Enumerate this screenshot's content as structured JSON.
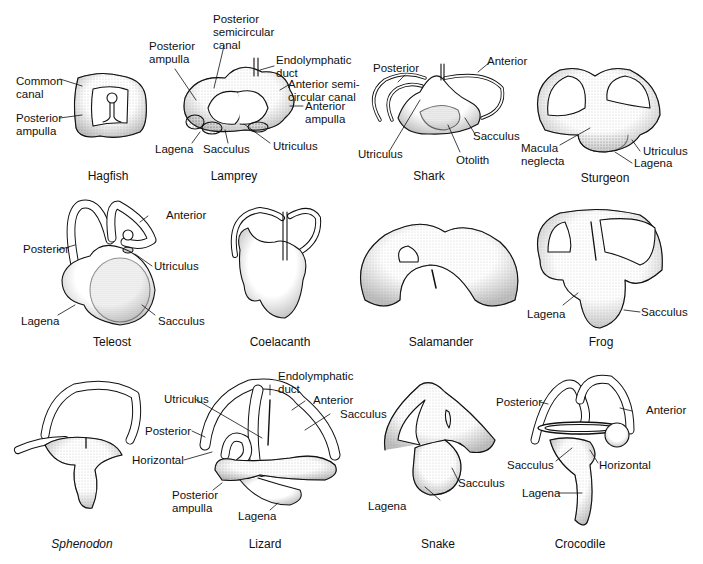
{
  "figure": {
    "panels": [
      {
        "id": "hagfish",
        "caption": "Hagfish",
        "italic": false,
        "labels": [
          "Common canal",
          "Posterior ampulla"
        ]
      },
      {
        "id": "lamprey",
        "caption": "Lamprey",
        "italic": false,
        "labels": [
          "Posterior semicircular canal",
          "Posterior ampulla",
          "Endolymphatic duct",
          "Anterior semi-circular canal",
          "Anterior ampulla",
          "Lagena",
          "Sacculus",
          "Utriculus"
        ]
      },
      {
        "id": "shark",
        "caption": "Shark",
        "italic": false,
        "labels": [
          "Posterior",
          "Anterior",
          "Sacculus",
          "Utriculus",
          "Otolith"
        ]
      },
      {
        "id": "sturgeon",
        "caption": "Sturgeon",
        "italic": false,
        "labels": [
          "Macula neglecta",
          "Utriculus",
          "Lagena"
        ]
      },
      {
        "id": "teleost",
        "caption": "Teleost",
        "italic": false,
        "labels": [
          "Anterior",
          "Posterior",
          "Utriculus",
          "Lagena",
          "Sacculus"
        ]
      },
      {
        "id": "coelacanth",
        "caption": "Coelacanth",
        "italic": false,
        "labels": []
      },
      {
        "id": "salamander",
        "caption": "Salamander",
        "italic": false,
        "labels": []
      },
      {
        "id": "frog",
        "caption": "Frog",
        "italic": false,
        "labels": [
          "Lagena",
          "Sacculus"
        ]
      },
      {
        "id": "sphenodon",
        "caption": "Sphenodon",
        "italic": true,
        "labels": []
      },
      {
        "id": "lizard",
        "caption": "Lizard",
        "italic": false,
        "labels": [
          "Endolymphatic duct",
          "Utriculus",
          "Anterior",
          "Sacculus",
          "Posterior",
          "Horizontal",
          "Posterior ampulla",
          "Lagena"
        ]
      },
      {
        "id": "snake",
        "caption": "Snake",
        "italic": false,
        "labels": [
          "Sacculus",
          "Lagena"
        ]
      },
      {
        "id": "crocodile",
        "caption": "Crocodile",
        "italic": false,
        "labels": [
          "Posterior",
          "Anterior",
          "Sacculus",
          "Horizontal",
          "Lagena"
        ]
      }
    ]
  },
  "labels": {
    "hagfish_common_1": "Common",
    "hagfish_common_2": "canal",
    "hagfish_postamp_1": "Posterior",
    "hagfish_postamp_2": "ampulla",
    "lamprey_postamp_1": "Posterior",
    "lamprey_postamp_2": "ampulla",
    "lamprey_postcanal_1": "Posterior",
    "lamprey_postcanal_2": "semicircular",
    "lamprey_postcanal_3": "canal",
    "lamprey_endo_1": "Endolymphatic",
    "lamprey_endo_2": "duct",
    "lamprey_antcanal_1": "Anterior semi-",
    "lamprey_antcanal_2": "circular canal",
    "lamprey_antamp_1": "Anterior",
    "lamprey_antamp_2": "ampulla",
    "lamprey_lagena": "Lagena",
    "lamprey_sacculus": "Sacculus",
    "lamprey_utriculus": "Utriculus",
    "shark_posterior": "Posterior",
    "shark_anterior": "Anterior",
    "shark_sacculus": "Sacculus",
    "shark_utriculus": "Utriculus",
    "shark_otolith": "Otolith",
    "sturgeon_macula_1": "Macula",
    "sturgeon_macula_2": "neglecta",
    "sturgeon_utriculus": "Utriculus",
    "sturgeon_lagena": "Lagena",
    "teleost_anterior": "Anterior",
    "teleost_posterior": "Posterior",
    "teleost_utriculus": "Utriculus",
    "teleost_lagena": "Lagena",
    "teleost_sacculus": "Sacculus",
    "frog_lagena": "Lagena",
    "frog_sacculus": "Sacculus",
    "lizard_endo_1": "Endolymphatic",
    "lizard_endo_2": "duct",
    "lizard_utriculus": "Utriculus",
    "lizard_anterior": "Anterior",
    "lizard_sacculus": "Sacculus",
    "lizard_posterior": "Posterior",
    "lizard_horizontal": "Horizontal",
    "lizard_postamp_1": "Posterior",
    "lizard_postamp_2": "ampulla",
    "lizard_lagena": "Lagena",
    "snake_sacculus": "Sacculus",
    "snake_lagena": "Lagena",
    "croc_posterior": "Posterior",
    "croc_anterior": "Anterior",
    "croc_sacculus": "Sacculus",
    "croc_horizontal": "Horizontal",
    "croc_lagena": "Lagena"
  },
  "captions": {
    "hagfish": "Hagfish",
    "lamprey": "Lamprey",
    "shark": "Shark",
    "sturgeon": "Sturgeon",
    "teleost": "Teleost",
    "coelacanth": "Coelacanth",
    "salamander": "Salamander",
    "frog": "Frog",
    "sphenodon": "Sphenodon",
    "lizard": "Lizard",
    "snake": "Snake",
    "crocodile": "Crocodile"
  },
  "colors": {
    "ink": "#111111",
    "stipple": "#9a9a9a",
    "background": "#ffffff"
  }
}
